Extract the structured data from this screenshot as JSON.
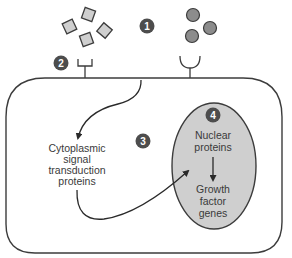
{
  "diagram": {
    "type": "cell-signaling-pathway",
    "colors": {
      "outline": "#3c3c3c",
      "ligand_square_fill": "#cfcfcf",
      "ligand_circle_fill": "#8c8c8c",
      "nucleus_fill": "#cfcfcf",
      "badge_fill": "#4d4d4d",
      "text": "#3a3a3a"
    },
    "badges": [
      {
        "id": "1",
        "label": "1"
      },
      {
        "id": "2",
        "label": "2"
      },
      {
        "id": "3",
        "label": "3"
      },
      {
        "id": "4",
        "label": "4"
      }
    ],
    "labels": {
      "cytoplasmic": [
        "Cytoplasmic",
        "signal",
        "transduction",
        "proteins"
      ],
      "nuclear_proteins": [
        "Nuclear",
        "proteins"
      ],
      "growth_factor_genes": [
        "Growth",
        "factor",
        "genes"
      ]
    },
    "nodes": [
      {
        "name": "Growth factors (square ligands)",
        "count": 4
      },
      {
        "name": "Ligands (round)",
        "count": 3
      },
      {
        "name": "Receptor (square-binding)"
      },
      {
        "name": "Receptor (round-binding)"
      },
      {
        "name": "Cytoplasmic signal transduction proteins"
      },
      {
        "name": "Nuclear proteins"
      },
      {
        "name": "Growth factor genes"
      }
    ],
    "edges": [
      {
        "from": "Receptor (square-binding)",
        "to": "Cytoplasmic signal transduction proteins"
      },
      {
        "from": "Cytoplasmic signal transduction proteins",
        "to": "Nuclear proteins"
      },
      {
        "from": "Nuclear proteins",
        "to": "Growth factor genes"
      }
    ]
  }
}
